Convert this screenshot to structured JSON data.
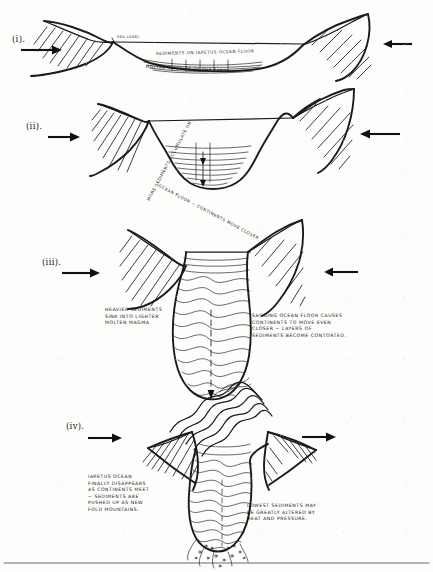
{
  "document": {
    "title": "Closure of the Iapetus Ocean — four stage cross-section sketch",
    "medium": "hand-drawn pen on paper, scanned"
  },
  "panels": [
    {
      "id": "panel-i",
      "label": "(i).",
      "labels": [
        {
          "name": "sea-level-label",
          "text": "SEA LEVEL"
        },
        {
          "name": "sediments-label",
          "text": "SEDIMENTS ON IAPETUS OCEAN FLOOR"
        },
        {
          "name": "molten-interior-label",
          "text": "MOLTEN INTERIOR OF THE EARTH"
        }
      ],
      "arrows": [
        {
          "name": "left-arrow",
          "direction": "right"
        },
        {
          "name": "right-arrow",
          "direction": "left"
        }
      ]
    },
    {
      "id": "panel-ii",
      "label": "(ii).",
      "labels": [
        {
          "name": "accumulation-label",
          "text": "MORE SEDIMENTS ACCUMULATE ON OCEAN FLOOR ~ CONTINENTS MOVE CLOSER"
        }
      ],
      "curved_text_top": "MORE SEDIMENTS ACCUMULATE ON",
      "curved_text_bottom": "OCEAN FLOOR ~ CONTINENTS MOVE CLOSER",
      "arrows": [
        {
          "name": "left-arrow",
          "direction": "right"
        },
        {
          "name": "right-arrow",
          "direction": "left"
        }
      ]
    },
    {
      "id": "panel-iii",
      "label": "(iii).",
      "note_left": "HEAVIER SEDIMENTS\nSINK INTO LIGHTER\nMOLTEN MAGMA",
      "note_right": "SAGGING OCEAN FLOOR CAUSES\nCONTINENTS TO MOVE EVEN\nCLOSER ~ LAYERS OF\nSEDIMENTS BECOME CONTORTED.",
      "arrows": [
        {
          "name": "left-arrow",
          "direction": "right"
        },
        {
          "name": "right-arrow",
          "direction": "left"
        }
      ]
    },
    {
      "id": "panel-iv",
      "label": "(iv).",
      "note_left": "IAPETUS OCEAN\nFINALLY DISAPPEARS\nAS CONTINENTS MEET\n~ SEDIMENTS ARE\nPUSHED UP AS NEW\nFOLD MOUNTAINS.",
      "note_right": "LOWEST SEDIMENTS MAY\nBE GREATLY ALTERED BY\nHEAT AND PRESSURE.",
      "arrows": [
        {
          "name": "left-arrow",
          "direction": "right"
        },
        {
          "name": "right-arrow",
          "direction": "right"
        }
      ]
    }
  ],
  "colors": {
    "paper": "#fdfdfb",
    "ink": "#1b1b1b",
    "arrow": "#111111"
  }
}
